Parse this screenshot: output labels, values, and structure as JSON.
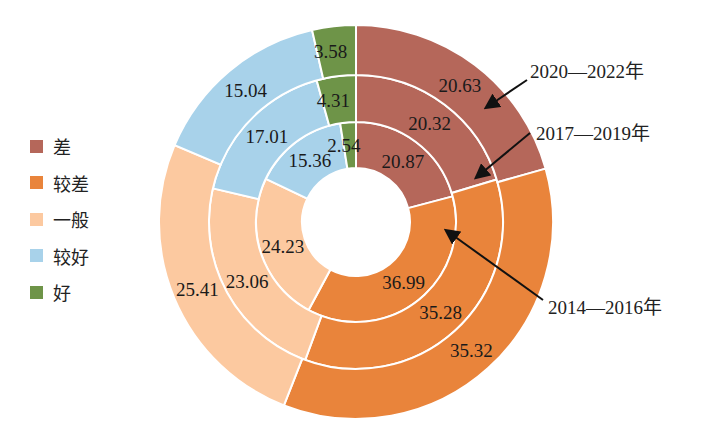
{
  "chart_data": {
    "type": "donut",
    "title": "",
    "categories": [
      "差",
      "较差",
      "一般",
      "较好",
      "好"
    ],
    "colors": [
      "#b5675a",
      "#e9843b",
      "#fcc9a0",
      "#a8d2ea",
      "#6e9448"
    ],
    "series": [
      {
        "name": "2014—2016年",
        "ring": "inner",
        "values": [
          20.87,
          36.99,
          24.23,
          15.36,
          2.54
        ]
      },
      {
        "name": "2017—2019年",
        "ring": "middle",
        "values": [
          20.32,
          35.28,
          23.06,
          17.01,
          4.31
        ]
      },
      {
        "name": "2020—2022年",
        "ring": "outer",
        "values": [
          20.63,
          35.32,
          25.41,
          15.04,
          3.58
        ]
      }
    ],
    "start_angle": "top (12 o'clock), clockwise",
    "legend_position": "left"
  },
  "legend": {
    "items": [
      {
        "label": "差",
        "color": "#b5675a"
      },
      {
        "label": "较差",
        "color": "#e9843b"
      },
      {
        "label": "一般",
        "color": "#fcc9a0"
      },
      {
        "label": "较好",
        "color": "#a8d2ea"
      },
      {
        "label": "好",
        "color": "#6e9448"
      }
    ]
  },
  "annotations": {
    "outer": "2020—2022年",
    "middle": "2017—2019年",
    "inner": "2014—2016年"
  }
}
